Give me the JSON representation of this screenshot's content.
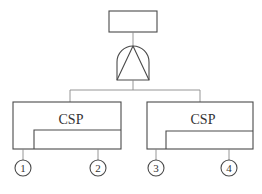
{
  "diagram": {
    "type": "fault-tree",
    "top_event": {
      "label": ""
    },
    "gate": {
      "type": "PAND-like gate (triangle inside)"
    },
    "blocks": [
      {
        "label": "CSP",
        "inputs": [
          {
            "number": "1"
          },
          {
            "number": "2"
          }
        ]
      },
      {
        "label": "CSP",
        "inputs": [
          {
            "number": "3"
          },
          {
            "number": "4"
          }
        ]
      }
    ]
  }
}
